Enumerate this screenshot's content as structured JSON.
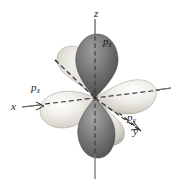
{
  "figure": {
    "background_color": "#ffffff",
    "width": 176,
    "height": 184
  },
  "axes": {
    "origin": {
      "x": 95,
      "y": 98
    },
    "items": [
      {
        "name": "x-axis",
        "label": "x",
        "style": "solid",
        "color": "#555555",
        "from": {
          "x": 22,
          "y": 107
        },
        "to": {
          "x": 171,
          "y": 88
        },
        "label_position": {
          "x": 11,
          "y": 101
        }
      },
      {
        "name": "y-axis",
        "label": "y",
        "style": "dashed",
        "color": "#2a2a2a",
        "from": {
          "x": 55,
          "y": 60
        },
        "to": {
          "x": 141,
          "y": 131
        },
        "label_position": {
          "x": 133,
          "y": 126
        }
      },
      {
        "name": "z-axis",
        "label": "z",
        "style": "solid-vertical",
        "color": "#6a6a6a",
        "from": {
          "x": 95,
          "y": 19
        },
        "to": {
          "x": 95,
          "y": 179
        },
        "label_position": {
          "x": 94,
          "y": 8
        }
      }
    ]
  },
  "orbitals": [
    {
      "name": "p-x-orbital",
      "label": "p",
      "subscript": "x",
      "axis": "x",
      "shade": "light",
      "fill_light": "#f2f0ec",
      "fill_dark": "#b9b6ae",
      "label_position": {
        "x": 31,
        "y": 82
      }
    },
    {
      "name": "p-y-orbital",
      "label": "p",
      "subscript": "y",
      "axis": "y",
      "shade": "light",
      "fill_light": "#eeece6",
      "fill_dark": "#b2afa7",
      "label_position": {
        "x": 127,
        "y": 112
      }
    },
    {
      "name": "p-z-orbital",
      "label": "p",
      "subscript": "z",
      "axis": "z",
      "shade": "dark",
      "fill_light": "#9a9a9a",
      "fill_dark": "#4a4a4a",
      "label_position": {
        "x": 103,
        "y": 36
      }
    }
  ]
}
